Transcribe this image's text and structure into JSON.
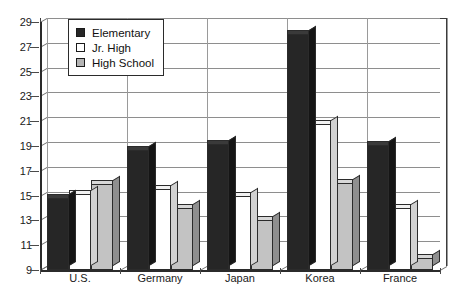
{
  "chart_data": {
    "type": "bar",
    "title": "",
    "subtitle": "",
    "xlabel": "",
    "ylabel": "",
    "ylim": [
      9,
      29
    ],
    "ytick_step": 2,
    "yticks": [
      9,
      11,
      13,
      15,
      17,
      19,
      21,
      23,
      25,
      27,
      29
    ],
    "grid": true,
    "legend_position": "top-left",
    "categories": [
      "U.S.",
      "Germany",
      "Japan",
      "Korea",
      "France"
    ],
    "series": [
      {
        "name": "Elementary",
        "color": "#262626",
        "values": [
          14.8,
          18.7,
          19.2,
          28.0,
          19.1
        ]
      },
      {
        "name": "Jr. High",
        "color": "#ffffff",
        "values": [
          15.1,
          15.5,
          15.0,
          20.8,
          14.0
        ]
      },
      {
        "name": "High School",
        "color": "#c3c3c3",
        "values": [
          15.9,
          14.0,
          13.0,
          16.0,
          10.0
        ]
      }
    ]
  },
  "legend": {
    "items": [
      {
        "label": "Elementary",
        "swatch": "elementary"
      },
      {
        "label": "Jr. High",
        "swatch": "jrhigh"
      },
      {
        "label": "High School",
        "swatch": "highschool"
      }
    ]
  }
}
